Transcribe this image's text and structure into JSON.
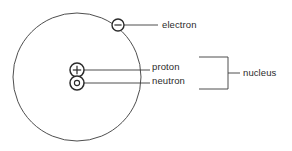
{
  "diagram": {
    "background_color": "#ffffff",
    "stroke_color": "#3a3a3a",
    "text_color": "#2b2b2b",
    "labels": {
      "electron": "electron",
      "proton": "proton",
      "neutron": "neutron",
      "nucleus": "nucleus"
    },
    "symbols": {
      "electron_charge": "−",
      "proton_charge": "+",
      "neutron_charge": ""
    },
    "geometry": {
      "orbit_center_x": 77,
      "orbit_center_y": 77,
      "orbit_radius": 64,
      "electron_x": 118,
      "electron_y": 25,
      "electron_radius": 6,
      "proton_x": 77,
      "proton_y": 70,
      "proton_radius": 7,
      "neutron_x": 77,
      "neutron_y": 83,
      "neutron_radius": 7,
      "bracket_left": 199,
      "bracket_right": 228,
      "bracket_top": 57,
      "bracket_bottom": 89
    }
  }
}
